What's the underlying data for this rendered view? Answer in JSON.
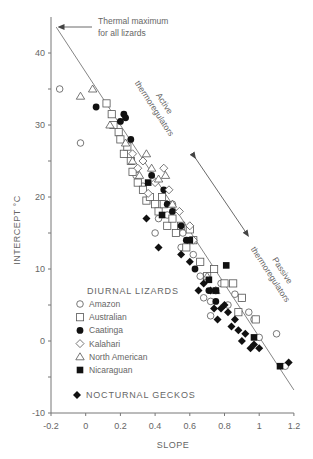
{
  "chart_data": {
    "type": "scatter",
    "title": "",
    "xlabel": "SLOPE",
    "ylabel": "INTERCEPT °C",
    "xlim": [
      -0.2,
      1.2
    ],
    "ylim": [
      -10,
      45
    ],
    "xticks": [
      -0.2,
      0,
      0.2,
      0.4,
      0.6,
      0.8,
      1,
      1.2
    ],
    "xtick_labels": [
      "-0.2",
      "0",
      "0.2",
      "0.4",
      "0.6",
      "0.8",
      "1",
      "1.2"
    ],
    "yticks": [
      -10,
      -5,
      0,
      5,
      10,
      15,
      20,
      25,
      30,
      35,
      40
    ],
    "ytick_labels": {
      "-10": "-10",
      "0": "0",
      "10": "10",
      "20": "20",
      "30": "30",
      "40": "40"
    },
    "grid": false,
    "legend_position": "lower-left inside",
    "legend_group_title": "DIURNAL LIZARDS",
    "annotations": [
      {
        "text_lines": [
          "Thermal maximum",
          "for all lizards"
        ],
        "type": "arrow-label"
      },
      {
        "text_lines": [
          "Active",
          "thermoregulators"
        ],
        "type": "rotated-label"
      },
      {
        "text_lines": [
          "Passive",
          "thermoregulators"
        ],
        "type": "rotated-label"
      }
    ],
    "regression_line": {
      "x": [
        -0.17,
        1.2
      ],
      "y": [
        43.6,
        -6.8
      ]
    },
    "series": [
      {
        "name": "Amazon",
        "marker": "open-circle",
        "points": [
          [
            -0.15,
            35
          ],
          [
            -0.03,
            27.5
          ],
          [
            0.29,
            23
          ],
          [
            0.33,
            21.5
          ],
          [
            0.4,
            15
          ],
          [
            0.42,
            17
          ],
          [
            0.47,
            17.5
          ],
          [
            0.5,
            19
          ],
          [
            0.55,
            13
          ],
          [
            0.56,
            15
          ],
          [
            0.62,
            12
          ],
          [
            0.66,
            9
          ],
          [
            0.68,
            6
          ],
          [
            0.72,
            5.5
          ],
          [
            0.72,
            3.5
          ],
          [
            0.75,
            7
          ],
          [
            0.78,
            8
          ],
          [
            0.82,
            5
          ],
          [
            0.86,
            6.5
          ],
          [
            0.9,
            6
          ],
          [
            0.94,
            4
          ],
          [
            0.97,
            3
          ],
          [
            1.0,
            0.5
          ],
          [
            1.1,
            1
          ],
          [
            1.15,
            -3.5
          ]
        ]
      },
      {
        "name": "Australian",
        "marker": "open-square",
        "points": [
          [
            0.12,
            33
          ],
          [
            0.15,
            31.5
          ],
          [
            0.16,
            30
          ],
          [
            0.19,
            29
          ],
          [
            0.2,
            28
          ],
          [
            0.22,
            26
          ],
          [
            0.24,
            27
          ],
          [
            0.26,
            25
          ],
          [
            0.27,
            23.5
          ],
          [
            0.3,
            22
          ],
          [
            0.33,
            21
          ],
          [
            0.35,
            19.5
          ],
          [
            0.37,
            20
          ],
          [
            0.4,
            19
          ],
          [
            0.42,
            18
          ],
          [
            0.44,
            20
          ],
          [
            0.45,
            19
          ],
          [
            0.47,
            16
          ],
          [
            0.5,
            17
          ],
          [
            0.52,
            15
          ],
          [
            0.55,
            16
          ],
          [
            0.58,
            13
          ],
          [
            0.6,
            15.5
          ],
          [
            0.62,
            14
          ],
          [
            0.66,
            11
          ],
          [
            0.7,
            9
          ],
          [
            0.74,
            10
          ],
          [
            0.8,
            8
          ],
          [
            0.85,
            8
          ],
          [
            0.88,
            4
          ],
          [
            0.9,
            6
          ],
          [
            0.98,
            3
          ]
        ]
      },
      {
        "name": "Caatinga",
        "marker": "filled-circle",
        "points": [
          [
            0.06,
            32.5
          ],
          [
            0.2,
            30.5
          ],
          [
            0.22,
            31.5
          ],
          [
            0.23,
            31
          ],
          [
            0.26,
            28
          ],
          [
            0.38,
            23
          ],
          [
            0.45,
            21
          ],
          [
            0.47,
            19
          ],
          [
            0.5,
            18
          ],
          [
            0.55,
            16
          ],
          [
            0.58,
            14
          ],
          [
            0.63,
            10
          ],
          [
            0.71,
            7
          ],
          [
            0.75,
            5.5
          ]
        ]
      },
      {
        "name": "Kalahari",
        "marker": "open-diamond",
        "points": [
          [
            0.27,
            26
          ],
          [
            0.3,
            24
          ],
          [
            0.33,
            25
          ],
          [
            0.36,
            20.5
          ],
          [
            0.4,
            22
          ],
          [
            0.45,
            24
          ],
          [
            0.48,
            21
          ],
          [
            0.54,
            18
          ],
          [
            0.6,
            16
          ],
          [
            0.62,
            14
          ]
        ]
      },
      {
        "name": "North American",
        "marker": "open-triangle",
        "points": [
          [
            -0.03,
            34
          ],
          [
            0.04,
            35
          ],
          [
            0.14,
            30
          ],
          [
            0.23,
            27.5
          ],
          [
            0.27,
            25
          ],
          [
            0.31,
            23
          ],
          [
            0.35,
            26
          ],
          [
            0.38,
            24
          ],
          [
            0.42,
            22.5
          ],
          [
            0.46,
            23
          ],
          [
            0.5,
            19
          ],
          [
            0.7,
            9
          ],
          [
            0.75,
            7
          ]
        ]
      },
      {
        "name": "Nicaraguan",
        "marker": "filled-square",
        "points": [
          [
            0.36,
            22
          ],
          [
            0.44,
            17.5
          ],
          [
            0.6,
            14
          ],
          [
            0.71,
            8.5
          ],
          [
            0.75,
            7
          ],
          [
            0.81,
            10.5
          ],
          [
            1.12,
            -3.5
          ],
          [
            0.97,
            0.5
          ]
        ]
      },
      {
        "name": "NOCTURNAL GECKOS",
        "marker": "filled-diamond",
        "points": [
          [
            0.35,
            17
          ],
          [
            0.42,
            13
          ],
          [
            0.55,
            12
          ],
          [
            0.6,
            11
          ],
          [
            0.65,
            7
          ],
          [
            0.68,
            8
          ],
          [
            0.72,
            7
          ],
          [
            0.74,
            4.5
          ],
          [
            0.76,
            3
          ],
          [
            0.78,
            4.5
          ],
          [
            0.8,
            5
          ],
          [
            0.82,
            4
          ],
          [
            0.84,
            2
          ],
          [
            0.86,
            3
          ],
          [
            0.88,
            1.5
          ],
          [
            0.9,
            0
          ],
          [
            0.92,
            1
          ],
          [
            0.95,
            -1
          ],
          [
            0.97,
            -0.5
          ],
          [
            1.0,
            -1
          ],
          [
            1.17,
            -3
          ]
        ]
      }
    ]
  }
}
